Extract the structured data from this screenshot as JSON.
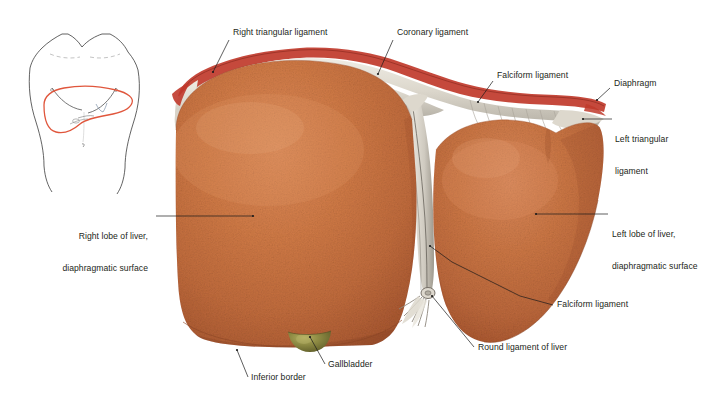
{
  "figure": {
    "colors": {
      "liver_base": "#c9703f",
      "liver_mid": "#d07a46",
      "liver_dark": "#a5522c",
      "liver_highlight": "#dd9064",
      "diaphragm_pale": "#e5e1d8",
      "diaphragm_gray": "#b9b5ab",
      "diaphragm_red_edge": "#c0392b",
      "gallbladder": "#7d7a3a",
      "gallbladder_highlight": "#a8a355",
      "label_text": "#231f20",
      "leader_line": "#1a1a1a",
      "thumb_outline": "#3b3b3b",
      "thumb_liver": "#e0563c"
    }
  },
  "thumbnail": {
    "name": "body-orientation-diagram",
    "description": "Anterior torso outline with liver region outlined in red"
  },
  "labels": [
    {
      "id": "right-triangular-ligament",
      "lines": [
        "Right triangular ligament"
      ],
      "align": "left",
      "x": 233,
      "y": 27,
      "leader": [
        [
          229,
          40
        ],
        [
          213,
          72
        ]
      ]
    },
    {
      "id": "coronary-ligament",
      "lines": [
        "Coronary ligament"
      ],
      "align": "left",
      "x": 397,
      "y": 27,
      "leader": [
        [
          393,
          40
        ],
        [
          378,
          74
        ]
      ]
    },
    {
      "id": "falciform-ligament-top",
      "lines": [
        "Falciform ligament"
      ],
      "align": "left",
      "x": 497,
      "y": 70,
      "leader": [
        [
          493,
          81
        ],
        [
          478,
          102
        ]
      ]
    },
    {
      "id": "diaphragm",
      "lines": [
        "Diaphragm"
      ],
      "align": "left",
      "x": 614,
      "y": 78,
      "leader": [
        [
          610,
          88
        ],
        [
          597,
          100
        ]
      ]
    },
    {
      "id": "left-triangular-ligament",
      "lines": [
        "Left triangular",
        "ligament"
      ],
      "align": "left",
      "x": 615,
      "y": 113,
      "leader": [
        [
          612,
          119
        ],
        [
          583,
          119
        ]
      ]
    },
    {
      "id": "right-lobe-of-liver",
      "lines": [
        "Right lobe of liver,",
        "diaphragmatic surface"
      ],
      "align": "right",
      "x": 68,
      "y": 210,
      "leader": [
        [
          156,
          216
        ],
        [
          253,
          216
        ]
      ]
    },
    {
      "id": "left-lobe-of-liver",
      "lines": [
        "Left lobe of liver,",
        "diaphragmatic surface"
      ],
      "align": "left",
      "x": 612,
      "y": 208,
      "leader": [
        [
          608,
          214
        ],
        [
          536,
          214
        ]
      ]
    },
    {
      "id": "falciform-ligament-lower",
      "lines": [
        "Falciform ligament"
      ],
      "align": "left",
      "x": 557,
      "y": 299,
      "leader": [
        [
          553,
          305
        ],
        [
          520,
          296
        ]
      ]
    },
    {
      "id": "round-ligament-of-liver",
      "lines": [
        "Round ligament of liver"
      ],
      "align": "left",
      "x": 478,
      "y": 342,
      "leader": [
        [
          474,
          347
        ],
        [
          432,
          296
        ]
      ]
    },
    {
      "id": "gallbladder",
      "lines": [
        "Gallbladder"
      ],
      "align": "left",
      "x": 328,
      "y": 359,
      "leader": [
        [
          325,
          364
        ],
        [
          310,
          337
        ]
      ]
    },
    {
      "id": "inferior-border",
      "lines": [
        "Inferior border"
      ],
      "align": "left",
      "x": 251,
      "y": 372,
      "leader": [
        [
          248,
          377
        ],
        [
          237,
          350
        ]
      ]
    }
  ]
}
